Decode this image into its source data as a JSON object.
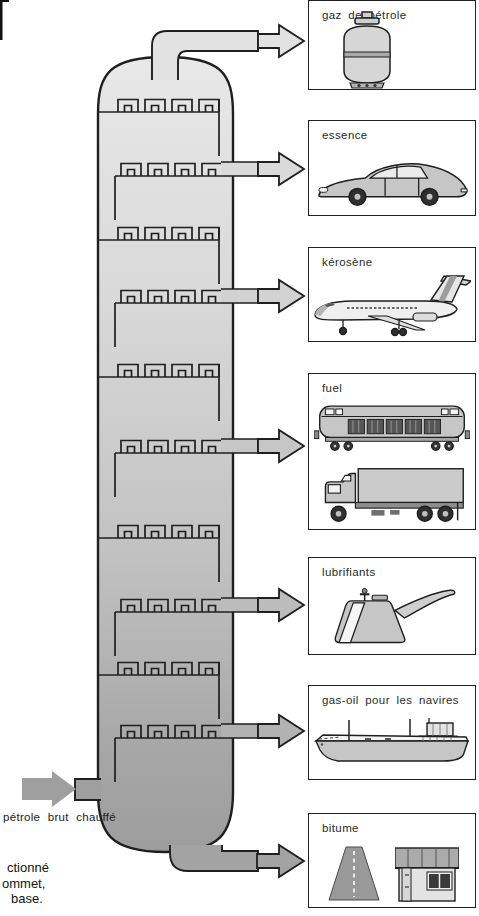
{
  "figure": {
    "feed_label": "pétrole brut chauffé",
    "caption_lines": [
      "ctionné",
      "ommet,",
      "base."
    ],
    "products": [
      {
        "label": "gaz de pétrole",
        "icon": "gas-cylinder-icon"
      },
      {
        "label": "essence",
        "icon": "car-icon"
      },
      {
        "label": "kérosène",
        "icon": "airplane-icon"
      },
      {
        "label": "fuel",
        "icon": "diesel-locomotive-icon, cargo-truck-icon"
      },
      {
        "label": "lubrifiants",
        "icon": "oil-can-icon"
      },
      {
        "label": "gas-oil pour les navires",
        "icon": "cargo-ship-icon"
      },
      {
        "label": "bitume",
        "icon": "road-icon, house-icon"
      }
    ],
    "colors": {
      "background": "#ffffff",
      "outline": "#1f1f1f",
      "column_top": "#e7e7e7",
      "column_bottom": "#9d9d9d",
      "arrow_gas": "#e2e2e2",
      "arrow_essence": "#dadada",
      "arrow_kerosene": "#d2d2d2",
      "arrow_fuel": "#c6c6c6",
      "arrow_lubricants": "#bcbcbc",
      "arrow_ship_gasoil": "#b2b2b2",
      "arrow_bitumen": "#a3a3a3",
      "arrow_feed": "#9f9f9f"
    }
  }
}
